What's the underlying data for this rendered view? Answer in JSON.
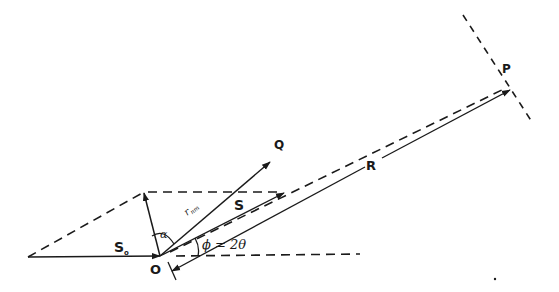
{
  "diagram": {
    "type": "vector-diagram",
    "colors": {
      "ink": "#1a1a1a",
      "background": "#ffffff"
    },
    "labels": {
      "P": "P",
      "Q": "Q",
      "R": "R",
      "S": "S",
      "S0": "S",
      "S0_sub": "o",
      "O": "O",
      "r": "r",
      "r_sub": "nm",
      "alpha": "α",
      "phi": "ϕ = 2θ"
    },
    "points": {
      "left_vertex": [
        28,
        257
      ],
      "O": [
        160,
        256
      ],
      "normal_tip": [
        144,
        192
      ],
      "Q_tip": [
        270,
        162
      ],
      "S_tip": [
        284,
        193
      ],
      "P": [
        508,
        87
      ]
    },
    "vectors": [
      {
        "name": "S0",
        "from": "left_vertex",
        "to": "O",
        "style": "solid",
        "arrow": "end"
      },
      {
        "name": "normal",
        "from": "O",
        "to": "normal_tip",
        "style": "solid",
        "arrow": "end"
      },
      {
        "name": "r_nm",
        "from": "O",
        "to": "Q_tip",
        "style": "solid",
        "arrow": "end"
      },
      {
        "name": "S",
        "from": "O",
        "to": "S_tip",
        "style": "solid",
        "arrow": "end"
      },
      {
        "name": "R",
        "from": [
          170,
          272
        ],
        "to": [
          510,
          90
        ],
        "style": "solid",
        "arrow": "both"
      }
    ],
    "dashed_lines": [
      {
        "name": "left-diagonal",
        "from": "left_vertex",
        "to": "normal_tip"
      },
      {
        "name": "upper-horizontal",
        "from": "normal_tip",
        "to": [
          282,
          192
        ]
      },
      {
        "name": "O-to-P",
        "from": "O",
        "to": "P"
      },
      {
        "name": "lower-horizontal",
        "from": [
          176,
          256
        ],
        "to": [
          360,
          254
        ]
      },
      {
        "name": "wavefront-at-P",
        "from": [
          463,
          15
        ],
        "to": [
          532,
          122
        ]
      }
    ],
    "angles": [
      {
        "name": "alpha",
        "between": [
          "normal",
          "r_nm"
        ]
      },
      {
        "name": "phi",
        "value": "2θ",
        "between": [
          "horizontal",
          "S"
        ]
      }
    ]
  }
}
